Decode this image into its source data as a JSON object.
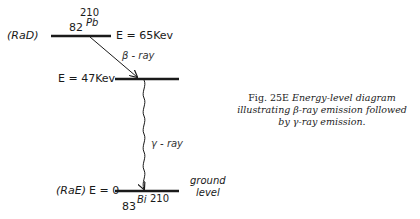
{
  "diagram": {
    "levels": [
      {
        "id": "pb210",
        "label_left": "(RaD)",
        "energy": "E = 65Kev",
        "nuclide": {
          "atomic_number": "82",
          "symbol": "Pb",
          "mass_number": "210"
        }
      },
      {
        "id": "intermediate",
        "energy": "E = 47Kev"
      },
      {
        "id": "bi210",
        "label_left": "(RaE)",
        "energy": "E = 0",
        "nuclide": {
          "atomic_number": "83",
          "symbol": "Bi",
          "mass_number": "210"
        },
        "label_right_line1": "ground",
        "label_right_line2": "level"
      }
    ],
    "transitions": [
      {
        "from": "pb210",
        "to": "intermediate",
        "type": "straight-arrow",
        "label": "β - ray"
      },
      {
        "from": "intermediate",
        "to": "bi210",
        "type": "wavy-arrow",
        "label": "γ - ray"
      }
    ]
  },
  "caption": {
    "figure": "Fig. 25E",
    "text": "Energy-level diagram illustrating β-ray emission followed by γ-ray emission."
  }
}
